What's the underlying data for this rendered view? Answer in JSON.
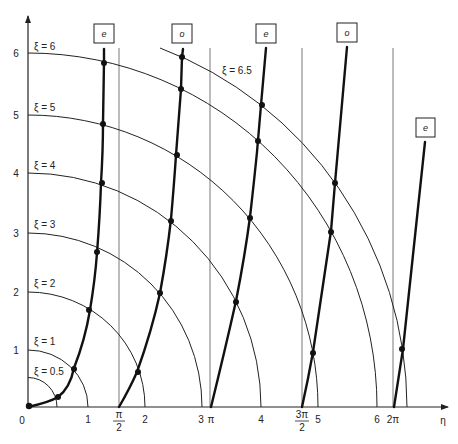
{
  "figure": {
    "axes": {
      "x_label": "η",
      "origin_label": "0",
      "x_ticks": [
        {
          "label": "1",
          "x": 88
        },
        {
          "label": "2",
          "x": 145
        },
        {
          "label": "3",
          "x": 202
        },
        {
          "label": "4",
          "x": 261
        },
        {
          "label": "5",
          "x": 318
        },
        {
          "label": "6",
          "x": 377
        }
      ],
      "pi_ticks": [
        {
          "label": "π",
          "x": 210,
          "stacked": false
        },
        {
          "num": "π",
          "den": "2",
          "x": 119,
          "stacked": true
        },
        {
          "num": "3π",
          "den": "2",
          "x": 302,
          "stacked": true
        },
        {
          "label": "2π",
          "x": 393,
          "stacked": false
        }
      ],
      "y_ticks": [
        {
          "label": "1",
          "y": 350
        },
        {
          "label": "2",
          "y": 292
        },
        {
          "label": "3",
          "y": 233
        },
        {
          "label": "4",
          "y": 173
        },
        {
          "label": "5",
          "y": 115
        },
        {
          "label": "6",
          "y": 53
        }
      ]
    },
    "xi_curves": [
      {
        "label": "ξ = 0.5",
        "r": 0.5
      },
      {
        "label": "ξ = 1",
        "r": 1
      },
      {
        "label": "ξ = 2",
        "r": 2
      },
      {
        "label": "ξ = 3",
        "r": 3
      },
      {
        "label": "ξ = 4",
        "r": 4
      },
      {
        "label": "ξ = 5",
        "r": 5
      },
      {
        "label": "ξ = 6",
        "r": 6
      },
      {
        "label": "ξ = 6.5",
        "r": 6.5
      }
    ],
    "mode_boxes": [
      {
        "label": "e",
        "x": 104,
        "y": 36
      },
      {
        "label": "o",
        "x": 182,
        "y": 36
      },
      {
        "label": "e",
        "x": 265,
        "y": 36
      },
      {
        "label": "o",
        "x": 347,
        "y": 36
      },
      {
        "label": "e",
        "x": 425,
        "y": 131
      }
    ]
  }
}
